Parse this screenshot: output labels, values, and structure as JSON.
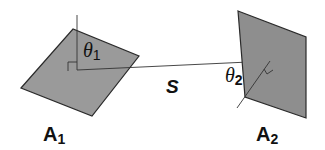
{
  "diagram": {
    "colors": {
      "plate_fill": "#9a9a9a",
      "plate_stroke": "#2a2a2a",
      "line": "#333333",
      "text": "#111111"
    },
    "surface1": {
      "label": "A",
      "subscript": "1",
      "angle_symbol": "θ",
      "angle_subscript": "1"
    },
    "surface2": {
      "label": "A",
      "subscript": "2",
      "angle_symbol": "θ",
      "angle_subscript": "2"
    },
    "distance": {
      "label": "S"
    }
  }
}
